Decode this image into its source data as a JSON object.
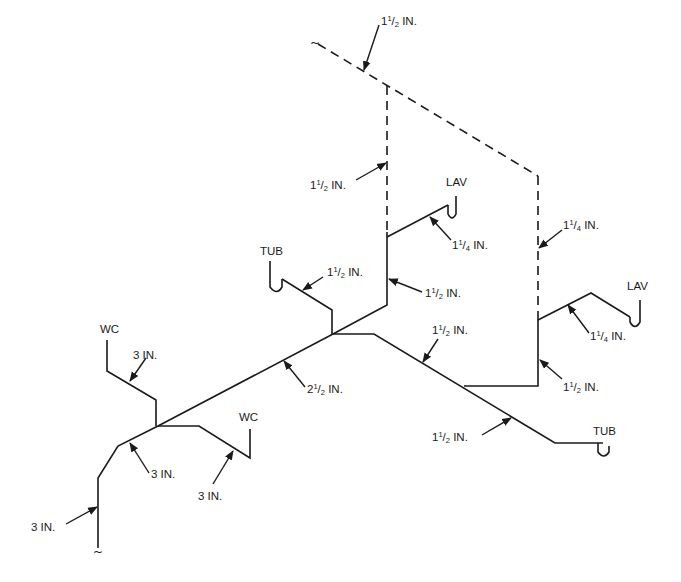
{
  "diagram": {
    "type": "isometric plumbing drainage/vent riser diagram",
    "fixtures": {
      "lav_upper": "LAV",
      "lav_right": "LAV",
      "tub_upper": "TUB",
      "tub_lower": "TUB",
      "wc_left": "WC",
      "wc_center": "WC"
    },
    "pipe_labels": {
      "vent_top": {
        "whole": "1",
        "num": "1",
        "den": "2",
        "unit": "IN."
      },
      "vent_riser_left": {
        "whole": "1",
        "num": "1",
        "den": "2",
        "unit": "IN."
      },
      "lav_upper_branch": {
        "whole": "1",
        "num": "1",
        "den": "4",
        "unit": "IN."
      },
      "tub_upper_branch": {
        "whole": "1",
        "num": "1",
        "den": "2",
        "unit": "IN."
      },
      "stack_left_riser": {
        "whole": "1",
        "num": "1",
        "den": "2",
        "unit": "IN."
      },
      "vent_riser_right": {
        "whole": "1",
        "num": "1",
        "den": "4",
        "unit": "IN."
      },
      "lav_right_branch": {
        "whole": "1",
        "num": "1",
        "den": "4",
        "unit": "IN."
      },
      "horizontal_branch_upper": {
        "whole": "1",
        "num": "1",
        "den": "2",
        "unit": "IN."
      },
      "stack_right_riser": {
        "whole": "1",
        "num": "1",
        "den": "2",
        "unit": "IN."
      },
      "main_drain_2half": {
        "whole": "2",
        "num": "1",
        "den": "2",
        "unit": "IN."
      },
      "tub_lower_branch": {
        "whole": "1",
        "num": "1",
        "den": "2",
        "unit": "IN."
      },
      "wc_left_branch": {
        "text": "3 IN."
      },
      "main_drain_3": {
        "text": "3 IN."
      },
      "wc_center_branch": {
        "text": "3 IN."
      },
      "building_drain": {
        "text": "3 IN."
      }
    },
    "break_symbol": "~",
    "colors": {
      "line": "#1a1a1a",
      "background": "#ffffff"
    }
  }
}
